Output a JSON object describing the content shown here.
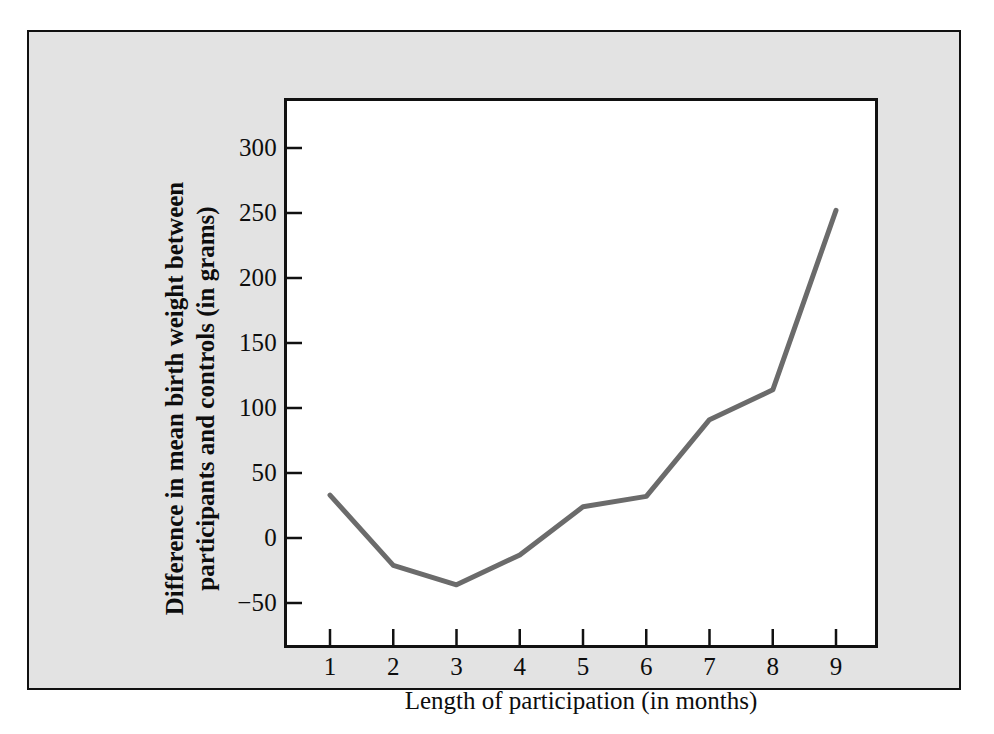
{
  "figure": {
    "background_color": "#e3e3e3",
    "plot_background_color": "#ffffff",
    "frame_color": "#111111",
    "line_color": "#6b6b6b"
  },
  "chart_data": {
    "type": "line",
    "title": "",
    "xlabel": "Length of participation (in months)",
    "ylabel_line1": "Difference in mean birth weight between",
    "ylabel_line2": "participants and controls (in grams)",
    "x": [
      1,
      2,
      3,
      4,
      5,
      6,
      7,
      8,
      9
    ],
    "values": [
      33,
      -21,
      -36,
      -13,
      24,
      32,
      91,
      114,
      252
    ],
    "xtick_labels": [
      "1",
      "2",
      "3",
      "4",
      "5",
      "6",
      "7",
      "8",
      "9"
    ],
    "ytick_labels": [
      "300",
      "250",
      "200",
      "150",
      "100",
      "50",
      "0",
      "−50"
    ],
    "ytick_values": [
      300,
      250,
      200,
      150,
      100,
      50,
      0,
      -50
    ],
    "xlim": [
      0.2,
      9.6
    ],
    "ylim": [
      -75,
      320
    ],
    "grid": false,
    "legend": null,
    "series_color": "#6b6b6b",
    "line_width": 5
  }
}
